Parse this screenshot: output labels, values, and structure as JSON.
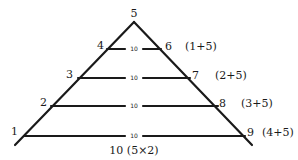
{
  "diagram": {
    "type": "triangle-with-rungs",
    "apex_label": "5",
    "rungs": [
      {
        "left": "4",
        "right": "6",
        "middle": "10",
        "note": "(1+5)"
      },
      {
        "left": "3",
        "right": "7",
        "middle": "10",
        "note": "(2+5)"
      },
      {
        "left": "2",
        "right": "8",
        "middle": "10",
        "note": "(3+5)"
      },
      {
        "left": "1",
        "right": "9",
        "middle": "10",
        "note": "(4+5)"
      }
    ],
    "base_label": "10 (5×2)",
    "stroke_color": "#1a1a1a",
    "background": "#ffffff"
  }
}
